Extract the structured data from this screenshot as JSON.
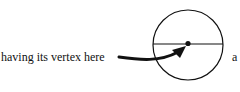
{
  "diagram": {
    "label": "having its vertex here",
    "trailing_text": "a",
    "circle": {
      "cx": 188,
      "cy": 45,
      "r": 35,
      "stroke": "#111111"
    },
    "diameter": {
      "x1": 153,
      "y1": 44,
      "x2": 223,
      "y2": 44
    },
    "vertex_dot": {
      "cx": 188,
      "cy": 43,
      "r": 2.5
    },
    "arrow": {
      "from": "label",
      "to": "vertex_dot",
      "color": "#111111"
    }
  }
}
